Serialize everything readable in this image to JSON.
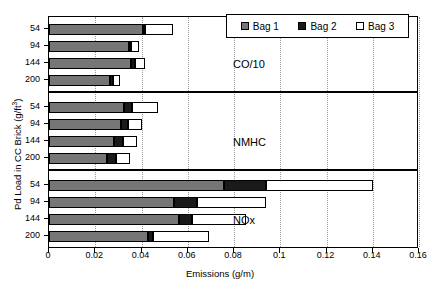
{
  "chart_data": {
    "type": "bar",
    "orientation": "horizontal",
    "stacked": true,
    "title": "",
    "xlabel": "Emissions (g/m)",
    "ylabel": "Pd Load in CC Brick (g/ft3)",
    "ylabel_parts": {
      "main": "Pd Load in CC Brick (g/ft",
      "sup": "3",
      "tail": ")"
    },
    "xlim": [
      0,
      0.16
    ],
    "xticks": [
      0,
      0.02,
      0.04,
      0.06,
      0.08,
      0.1,
      0.12,
      0.14,
      0.16
    ],
    "xtick_labels": [
      "0",
      "0.02",
      "0.04",
      "0.06",
      "0.08",
      "0.1",
      "0.12",
      "0.14",
      "0.16"
    ],
    "grid": "vertical-dotted",
    "legend": {
      "position": "top-right",
      "entries": [
        {
          "name": "Bag 1",
          "color": "#767676"
        },
        {
          "name": "Bag 2",
          "color": "#1a1a1a"
        },
        {
          "name": "Bag 3",
          "color": "#ffffff"
        }
      ]
    },
    "panels": [
      {
        "label": "CO/10",
        "categories": [
          "54",
          "94",
          "144",
          "200"
        ],
        "series": [
          {
            "name": "Bag 1",
            "values": [
              0.0405,
              0.0345,
              0.0355,
              0.0265
            ]
          },
          {
            "name": "Bag 2",
            "values": [
              0.001,
              0.001,
              0.0015,
              0.001
            ]
          },
          {
            "name": "Bag 3",
            "values": [
              0.012,
              0.0035,
              0.0045,
              0.003
            ]
          }
        ],
        "cumulative": [
          [
            0.0405,
            0.0415,
            0.0535
          ],
          [
            0.0345,
            0.0355,
            0.039
          ],
          [
            0.0355,
            0.037,
            0.0415
          ],
          [
            0.0265,
            0.0275,
            0.0305
          ]
        ]
      },
      {
        "label": "NMHC",
        "categories": [
          "54",
          "94",
          "144",
          "200"
        ],
        "series": [
          {
            "name": "Bag 1",
            "values": [
              0.0325,
              0.031,
              0.028,
              0.025
            ]
          },
          {
            "name": "Bag 2",
            "values": [
              0.0035,
              0.003,
              0.004,
              0.004
            ]
          },
          {
            "name": "Bag 3",
            "values": [
              0.011,
              0.006,
              0.006,
              0.006
            ]
          }
        ],
        "cumulative": [
          [
            0.0325,
            0.036,
            0.047
          ],
          [
            0.031,
            0.034,
            0.04
          ],
          [
            0.028,
            0.032,
            0.038
          ],
          [
            0.025,
            0.029,
            0.035
          ]
        ]
      },
      {
        "label": "NOx",
        "categories": [
          "54",
          "94",
          "144",
          "200"
        ],
        "series": [
          {
            "name": "Bag 1",
            "values": [
              0.0755,
              0.054,
              0.056,
              0.043
            ]
          },
          {
            "name": "Bag 2",
            "values": [
              0.0185,
              0.01,
              0.006,
              0.002
            ]
          },
          {
            "name": "Bag 3",
            "values": [
              0.046,
              0.03,
              0.023,
              0.024
            ]
          }
        ],
        "cumulative": [
          [
            0.0755,
            0.094,
            0.14
          ],
          [
            0.054,
            0.064,
            0.094
          ],
          [
            0.056,
            0.062,
            0.085
          ],
          [
            0.043,
            0.045,
            0.069
          ]
        ]
      }
    ]
  }
}
